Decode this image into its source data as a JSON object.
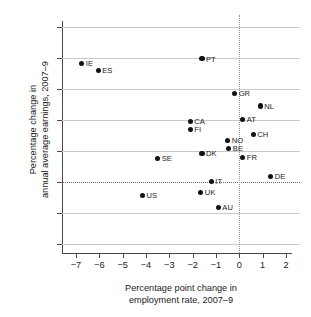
{
  "chart_data": {
    "type": "scatter",
    "title": "",
    "xlabel": "Percentage point change in\nemployment rate, 2007–9",
    "ylabel": "Percentage change in\nannual average earnings, 2007–9",
    "xlim": [
      -7.6,
      2.6
    ],
    "ylim": [
      -4.6,
      10.4
    ],
    "xticks": [
      -7,
      -6,
      -5,
      -4,
      -3,
      -2,
      -1,
      0,
      1,
      2
    ],
    "yticks": [
      -4,
      -2,
      0,
      2,
      4,
      6,
      8,
      10
    ],
    "xtick_labels": [
      "−7",
      "−6",
      "−5",
      "−4",
      "−3",
      "−2",
      "−1",
      "0",
      "1",
      "2"
    ],
    "ytick_labels": [
      "−4",
      "−2",
      "0",
      "2",
      "4",
      "6",
      "8",
      "10"
    ],
    "grid": "horizontal",
    "grid_color": "#c9c9c9",
    "reference_lines": [
      {
        "axis": "y",
        "value": 0,
        "style": "dotted"
      },
      {
        "axis": "x",
        "value": 0,
        "style": "dotted"
      }
    ],
    "legend": "none",
    "marker_color": "#111111",
    "points": [
      {
        "label": "IE",
        "x": -6.75,
        "y": 7.65
      },
      {
        "label": "ES",
        "x": -6.05,
        "y": 7.2
      },
      {
        "label": "PT",
        "x": -1.6,
        "y": 7.95
      },
      {
        "label": "GR",
        "x": -0.2,
        "y": 5.7
      },
      {
        "label": "NL",
        "x": 0.9,
        "y": 4.9
      },
      {
        "label": "CA",
        "x": -2.1,
        "y": 3.9
      },
      {
        "label": "AT",
        "x": 0.15,
        "y": 4.05
      },
      {
        "label": "FI",
        "x": -2.1,
        "y": 3.4
      },
      {
        "label": "CH",
        "x": 0.6,
        "y": 3.05
      },
      {
        "label": "NO",
        "x": -0.5,
        "y": 2.65
      },
      {
        "label": "BE",
        "x": -0.45,
        "y": 2.15
      },
      {
        "label": "DK",
        "x": -1.6,
        "y": 1.85
      },
      {
        "label": "FR",
        "x": 0.15,
        "y": 1.55
      },
      {
        "label": "SE",
        "x": -3.5,
        "y": 1.5
      },
      {
        "label": "DE",
        "x": 1.35,
        "y": 0.35
      },
      {
        "label": "IT",
        "x": -1.2,
        "y": 0.02
      },
      {
        "label": "UK",
        "x": -1.65,
        "y": -0.7
      },
      {
        "label": "US",
        "x": -4.15,
        "y": -0.9
      },
      {
        "label": "AU",
        "x": -0.9,
        "y": -1.65
      }
    ]
  }
}
